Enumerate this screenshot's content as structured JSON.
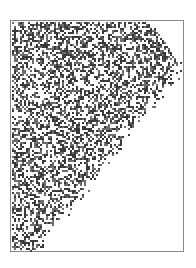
{
  "figure": {
    "frame": {
      "x": 10,
      "y": 20,
      "width": 174,
      "height": 232,
      "border_color": "#8a8a8a"
    },
    "pattern": {
      "cell_size": 2,
      "ink_color": "#3a3a3a",
      "mid_color": "#6e6e6e",
      "density": 0.5,
      "region_polygon": [
        [
          13,
          23
        ],
        [
          152,
          23
        ],
        [
          182,
          68
        ],
        [
          35,
          250
        ],
        [
          13,
          250
        ]
      ],
      "seed": 7
    }
  }
}
